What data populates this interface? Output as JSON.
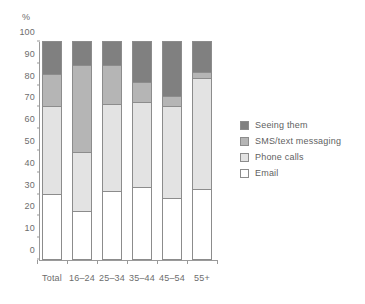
{
  "chart_data": {
    "type": "bar",
    "stacked": true,
    "title": "",
    "xlabel": "",
    "ylabel": "%",
    "ylim": [
      0,
      100
    ],
    "ytick_step": 10,
    "yticks": [
      100,
      90,
      80,
      70,
      60,
      50,
      40,
      30,
      20,
      10,
      0
    ],
    "grid": false,
    "legend_position": "right",
    "categories": [
      "Total",
      "16–24",
      "25–34",
      "35–44",
      "45–54",
      "55+"
    ],
    "series": [
      {
        "name": "Email",
        "color": "#ffffff",
        "values": [
          30,
          22,
          31,
          33,
          28,
          32
        ]
      },
      {
        "name": "Phone calls",
        "color": "#e3e3e3",
        "values": [
          40,
          27,
          40,
          39,
          42,
          51
        ]
      },
      {
        "name": "SMS/text messaging",
        "color": "#b5b5b5",
        "values": [
          15,
          40,
          18,
          9,
          5,
          3
        ]
      },
      {
        "name": "Seeing them",
        "color": "#808080",
        "values": [
          15,
          11,
          11,
          19,
          25,
          14
        ]
      }
    ],
    "cumulative_tops": [
      {
        "category": "Total",
        "email": 30,
        "phone_calls": 70,
        "sms": 85,
        "seeing_them": 100
      },
      {
        "category": "16–24",
        "email": 22,
        "phone_calls": 49,
        "sms": 89,
        "seeing_them": 100
      },
      {
        "category": "25–34",
        "email": 31,
        "phone_calls": 71,
        "sms": 89,
        "seeing_them": 100
      },
      {
        "category": "35–44",
        "email": 33,
        "phone_calls": 72,
        "sms": 81,
        "seeing_them": 100
      },
      {
        "category": "45–54",
        "email": 28,
        "phone_calls": 70,
        "sms": 75,
        "seeing_them": 100
      },
      {
        "category": "55+",
        "email": 32,
        "phone_calls": 83,
        "sms": 86,
        "seeing_them": 100
      }
    ]
  },
  "legend": {
    "items": [
      {
        "label": "Seeing them",
        "color": "#808080"
      },
      {
        "label": "SMS/text messaging",
        "color": "#b5b5b5"
      },
      {
        "label": "Phone calls",
        "color": "#e3e3e3"
      },
      {
        "label": "Email",
        "color": "#ffffff"
      }
    ]
  },
  "axis": {
    "y_unit_label": "%"
  }
}
